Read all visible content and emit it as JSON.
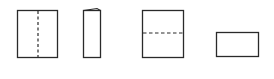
{
  "diagram": {
    "stroke_color": "#2a2a2a",
    "background": "#ffffff",
    "steps": [
      {
        "id": "step-1",
        "shape": "rectangle",
        "fold_line": "vertical-dashed"
      },
      {
        "id": "step-2",
        "shape": "narrow-rectangle",
        "fold_line": "none",
        "folded": true
      },
      {
        "id": "step-3",
        "shape": "rectangle",
        "fold_line": "horizontal-dashed"
      },
      {
        "id": "step-4",
        "shape": "wide-rectangle",
        "fold_line": "none",
        "folded": true
      }
    ]
  }
}
